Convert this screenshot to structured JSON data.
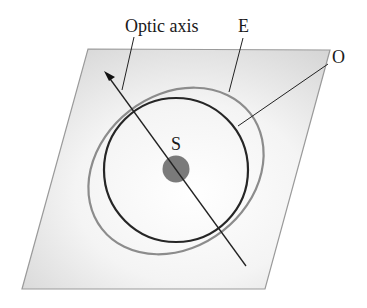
{
  "diagram": {
    "labels": {
      "optic_axis": "Optic axis",
      "extraordinary": "E",
      "ordinary": "O",
      "source": "S"
    },
    "colors": {
      "plane_border": "#9a9a9a",
      "plane_fill_dark": "#d6d6d6",
      "plane_fill_light": "#ffffff",
      "ordinary_circle": "#262626",
      "extraordinary_ellipse": "#8c8c8c",
      "source_dot": "#7a7a7a",
      "lines": "#222222"
    }
  }
}
